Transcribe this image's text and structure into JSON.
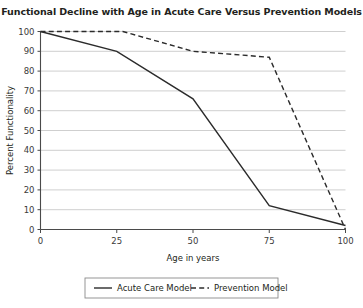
{
  "chart_data": {
    "type": "line",
    "title": "Functional Decline with Age in Acute Care Versus Prevention Models",
    "xlabel": "Age in years",
    "ylabel": "Percent Functionality",
    "xlim": [
      0,
      100
    ],
    "ylim": [
      0,
      100
    ],
    "xticks": [
      "0",
      "25",
      "50",
      "75",
      "100"
    ],
    "yticks": [
      "0",
      "10",
      "20",
      "30",
      "40",
      "50",
      "60",
      "70",
      "80",
      "90",
      "100"
    ],
    "grid": "horizontal",
    "legend_position": "below-axis-center",
    "series": [
      {
        "name": "Acute Care Model",
        "style": "solid",
        "color": "#2b2b2b",
        "x": [
          0,
          25,
          50,
          75,
          100
        ],
        "values": [
          100,
          90,
          66,
          12,
          2
        ]
      },
      {
        "name": "Prevention Model",
        "style": "dashed",
        "color": "#2b2b2b",
        "x": [
          0,
          27,
          50,
          75,
          100
        ],
        "values": [
          100,
          100,
          90,
          87,
          0
        ]
      }
    ]
  },
  "legend": {
    "items": [
      {
        "label": "Acute Care Model"
      },
      {
        "label": "Prevention Model"
      }
    ]
  }
}
